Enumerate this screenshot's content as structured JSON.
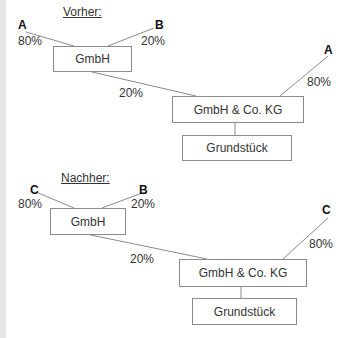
{
  "before": {
    "heading": "Vorher:",
    "gmbh": {
      "label": "GmbH",
      "shareholders": [
        {
          "name": "A",
          "share": "80%"
        },
        {
          "name": "B",
          "share": "20%"
        }
      ]
    },
    "kg": {
      "label": "GmbH & Co. KG",
      "gmbh_share": "20%",
      "direct_partner": {
        "name": "A",
        "share": "80%"
      }
    },
    "property": {
      "label": "Grundstück"
    }
  },
  "after": {
    "heading": "Nachher:",
    "gmbh": {
      "label": "GmbH",
      "shareholders": [
        {
          "name": "C",
          "share": "80%"
        },
        {
          "name": "B",
          "share": "20%"
        }
      ]
    },
    "kg": {
      "label": "GmbH & Co. KG",
      "gmbh_share": "20%",
      "direct_partner": {
        "name": "C",
        "share": "80%"
      }
    },
    "property": {
      "label": "Grundstück"
    }
  },
  "colors": {
    "line": "#8a8a8a",
    "box_border": "#8a8a8a",
    "text": "#333333",
    "edge": "#e6e6e6"
  }
}
